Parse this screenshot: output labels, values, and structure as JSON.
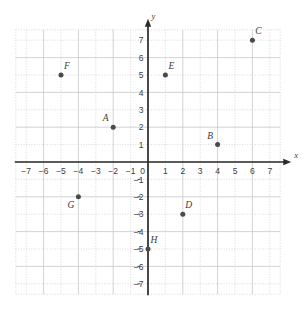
{
  "chart_data": {
    "type": "scatter",
    "title": "",
    "xlabel": "x",
    "ylabel": "y",
    "xlim": [
      -7.6,
      7.6
    ],
    "ylim": [
      -7.6,
      7.6
    ],
    "grid": true,
    "legend": "none",
    "x_ticks": [
      -7,
      -6,
      -5,
      -4,
      -3,
      -2,
      -1,
      0,
      1,
      2,
      3,
      4,
      5,
      6,
      7
    ],
    "y_ticks": [
      -7,
      -6,
      -5,
      -4,
      -3,
      -2,
      -1,
      1,
      2,
      3,
      4,
      5,
      6,
      7
    ],
    "x_tick_labels": [
      "−7",
      "−6",
      "−5",
      "−4",
      "−3",
      "−2",
      "−1",
      "0",
      "1",
      "2",
      "3",
      "4",
      "5",
      "6",
      "7"
    ],
    "y_tick_labels": [
      "−7",
      "−6",
      "−5",
      "−4",
      "−3",
      "−2",
      "−1",
      "1",
      "2",
      "3",
      "4",
      "5",
      "6",
      "7"
    ],
    "origin_label": "0",
    "points": [
      {
        "label": "A",
        "x": -2,
        "y": 2,
        "label_pos": "above-left"
      },
      {
        "label": "B",
        "x": 4,
        "y": 1,
        "label_pos": "above-left"
      },
      {
        "label": "C",
        "x": 6,
        "y": 7,
        "label_pos": "above-right"
      },
      {
        "label": "D",
        "x": 2,
        "y": -3,
        "label_pos": "above-right"
      },
      {
        "label": "E",
        "x": 1,
        "y": 5,
        "label_pos": "above-right"
      },
      {
        "label": "F",
        "x": -5,
        "y": 5,
        "label_pos": "above-right"
      },
      {
        "label": "G",
        "x": -4,
        "y": -2,
        "label_pos": "below-left"
      },
      {
        "label": "H",
        "x": 0,
        "y": -5,
        "label_pos": "above-right"
      }
    ],
    "colors": {
      "point": "#4a4a4a",
      "axis": "#2b2b2b",
      "grid_major": "#c8c8c8",
      "grid_minor": "#d0d0d0",
      "text": "#3c3c3c",
      "background": "#ffffff"
    }
  }
}
